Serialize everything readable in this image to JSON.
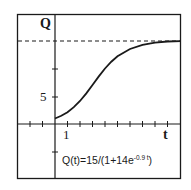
{
  "chart_data": {
    "type": "line",
    "title": "",
    "xlabel": "t",
    "ylabel": "Q",
    "function": "Q(t)=15/(1+14e^(-0.9t))",
    "annotation": {
      "prefix": "Q(t)=15/(1+14e",
      "exponent": "-0.9 t",
      "suffix": ")"
    },
    "asymptote": {
      "y": 15,
      "style": "dashed"
    },
    "x_tick_labels": [
      "1"
    ],
    "y_tick_labels": [
      "5"
    ],
    "x_ticks": [
      -3,
      -2,
      -1,
      1,
      2,
      3,
      4,
      5,
      6,
      7,
      8,
      9,
      10
    ],
    "y_ticks": [
      -5,
      5,
      10
    ],
    "xlim": [
      -3,
      10
    ],
    "ylim": [
      -9.5,
      20
    ],
    "grid": false,
    "series": [
      {
        "name": "Q(t)",
        "x": [
          0,
          0.5,
          1,
          1.5,
          2,
          2.5,
          3,
          3.5,
          4,
          4.5,
          5,
          6,
          7,
          8,
          9,
          10
        ],
        "values": [
          1.0,
          1.47,
          2.13,
          3.02,
          4.15,
          5.51,
          7.03,
          8.57,
          10.0,
          11.22,
          12.19,
          13.51,
          14.27,
          14.66,
          14.86,
          14.94
        ]
      }
    ]
  },
  "labels": {
    "q_axis": "Q",
    "t_axis": "t",
    "y_tick_5": "5",
    "x_tick_1": "1",
    "formula_main": "Q(t)=15/(1+14e",
    "formula_exp": "-0.9 t",
    "formula_end": ")"
  }
}
